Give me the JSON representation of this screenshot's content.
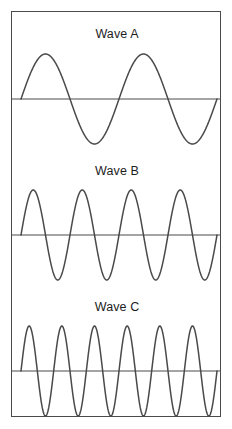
{
  "figure": {
    "background_color": "#ffffff",
    "border_color": "#4a4a4a",
    "stroke_color": "#4a4a4a",
    "width": 232,
    "height": 429
  },
  "waves": [
    {
      "label": "Wave A",
      "cycles": 2,
      "amplitude": 45,
      "baseline_y": 87,
      "peak_y": 42,
      "trough_y": 133,
      "phase": "rising-from-zero"
    },
    {
      "label": "Wave B",
      "cycles": 4,
      "amplitude": 46,
      "baseline_y": 223,
      "peak_y": 178,
      "trough_y": 270,
      "phase": "rising-from-zero"
    },
    {
      "label": "Wave C",
      "cycles": 6,
      "amplitude": 46,
      "baseline_y": 362,
      "peak_y": 316,
      "trough_y": 408,
      "phase": "rising-from-zero"
    }
  ],
  "chart_data": {
    "type": "line",
    "title": "",
    "xlabel": "",
    "ylabel": "",
    "grid": false,
    "legend_position": "inline-top-center",
    "x": [
      0,
      1
    ],
    "xlim": [
      0,
      1
    ],
    "ylim": [
      -1,
      1
    ],
    "series": [
      {
        "name": "Wave A",
        "waveform": "sine",
        "cycles": 2,
        "amplitude": 1.0,
        "relative_frequency": 1,
        "annotation": "Wave A"
      },
      {
        "name": "Wave B",
        "waveform": "sine",
        "cycles": 4,
        "amplitude": 1.0,
        "relative_frequency": 2,
        "annotation": "Wave B"
      },
      {
        "name": "Wave C",
        "waveform": "sine",
        "cycles": 6,
        "amplitude": 1.0,
        "relative_frequency": 3,
        "annotation": "Wave C"
      }
    ]
  }
}
